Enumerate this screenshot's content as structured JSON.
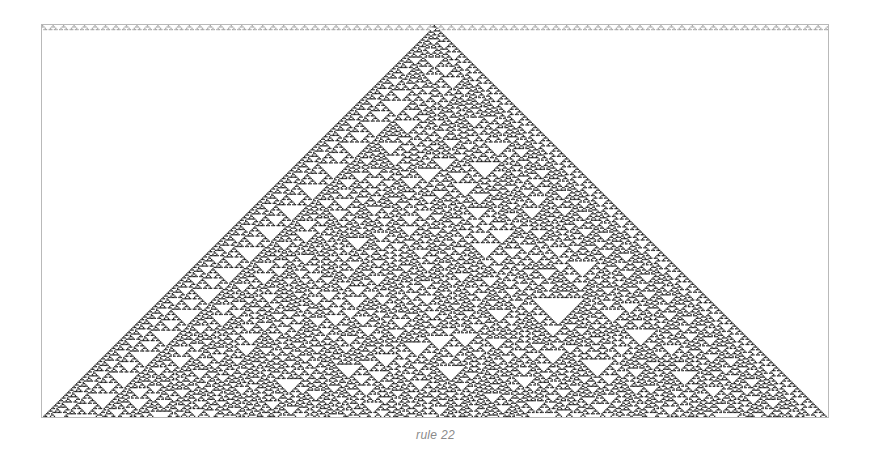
{
  "figure": {
    "caption": "rule 22",
    "border_color": "#b9b9b9",
    "background_color": "#ffffff",
    "caption_color": "#8a8a8a"
  },
  "chart_data": {
    "type": "heatmap",
    "title": "rule 22",
    "subtitle": "",
    "xlabel": "",
    "ylabel": "",
    "rule_number": 22,
    "rule_binary": "00010110",
    "rule_table": [
      {
        "neighborhood": "111",
        "output": 0
      },
      {
        "neighborhood": "110",
        "output": 0
      },
      {
        "neighborhood": "101",
        "output": 0
      },
      {
        "neighborhood": "100",
        "output": 1
      },
      {
        "neighborhood": "011",
        "output": 0
      },
      {
        "neighborhood": "010",
        "output": 1
      },
      {
        "neighborhood": "001",
        "output": 1
      },
      {
        "neighborhood": "000",
        "output": 0
      }
    ],
    "grid_columns": 600,
    "grid_rows": 300,
    "cell_width_px": 1.31,
    "cell_height_px": 1.307,
    "background_seed_period": 8,
    "background_seed_pattern": "10000000",
    "defect_column": 299,
    "colors": {
      "background_cell": "#a8a8a8",
      "defect_cell": "#242424",
      "empty_cell": "#ffffff"
    },
    "axis_ranges": {
      "x": [
        0,
        600
      ],
      "y": [
        0,
        300
      ]
    },
    "grid": false,
    "legend": false
  }
}
